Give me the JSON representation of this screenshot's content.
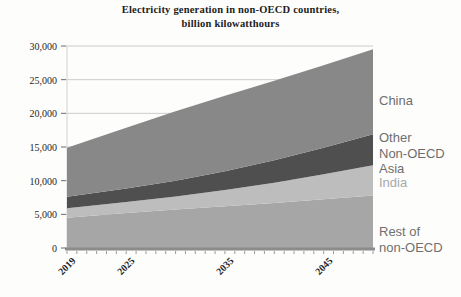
{
  "title": {
    "line1": "Electricity generation in non-OECD countries,",
    "line2": "billion kilowatthours"
  },
  "chart_data": {
    "type": "area",
    "stacked": true,
    "title": "Electricity generation in non-OECD countries, billion kilowatthours",
    "xlabel": "",
    "ylabel": "",
    "xlim": [
      2019,
      2050
    ],
    "ylim": [
      0,
      30000
    ],
    "grid": "horizontal-above-area",
    "legend_position": "right-overlay",
    "x": [
      2019,
      2025,
      2030,
      2035,
      2040,
      2045,
      2050
    ],
    "series": [
      {
        "name": "Rest of non-OECD",
        "color": "#a6a6a6",
        "values": [
          4500,
          5200,
          5700,
          6200,
          6700,
          7250,
          7800
        ]
      },
      {
        "name": "India",
        "color": "#bdbdbd",
        "values": [
          1400,
          1650,
          1950,
          2400,
          3000,
          3700,
          4500
        ]
      },
      {
        "name": "Other Non-OECD Asia",
        "color": "#4f4f4f",
        "values": [
          1700,
          2000,
          2350,
          2800,
          3350,
          3950,
          4600
        ]
      },
      {
        "name": "China",
        "color": "#888888",
        "values": [
          7300,
          9000,
          10300,
          11200,
          11800,
          12250,
          12600
        ]
      }
    ],
    "yticks": {
      "values": [
        0,
        5000,
        10000,
        15000,
        20000,
        25000,
        30000
      ],
      "labels": [
        "0",
        "5,000",
        "10,000",
        "15,000",
        "20,000",
        "25,000",
        "30,000"
      ]
    },
    "xticks": {
      "years": [
        2019,
        2025,
        2035,
        2045
      ],
      "labels": [
        "2019",
        "2025",
        "2035",
        "2045"
      ]
    },
    "right_labels": [
      {
        "text": "China",
        "top": 93,
        "color": "#6e6e6e"
      },
      {
        "text": "Other\nNon-OECD\nAsia",
        "top": 130,
        "color": "#6e6e6e"
      },
      {
        "text": "India",
        "top": 175,
        "color": "#a8a8a8"
      },
      {
        "text": "Rest of\nnon-OECD",
        "top": 224,
        "color": "#707070"
      }
    ]
  },
  "colors": {
    "grid": "#cccccc",
    "axis_line": "#8c8c8c",
    "left_axis_line": "#d2d2d2",
    "tick": "#6a6a6a",
    "minor_tick": "#9a9a9a"
  }
}
